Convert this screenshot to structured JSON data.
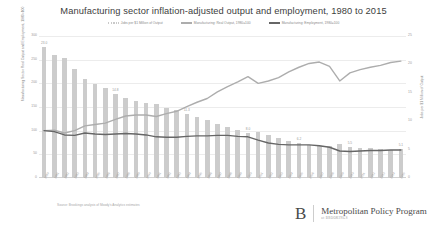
{
  "chart_data": {
    "type": "bar",
    "title": "Manufacturing sector inflation-adjusted output and employment, 1980 to 2015",
    "xlabel": "",
    "ylabel": "Manufacturing Sector Real Output and Employment, 1980=100",
    "ylabel_right": "Jobs per $1 Million of Output",
    "ylim": [
      0,
      300
    ],
    "ylim_right": [
      0,
      25
    ],
    "yticks": [
      0,
      50,
      100,
      150,
      200,
      250,
      300
    ],
    "yticks_right": [
      0,
      5,
      10,
      15,
      20,
      25
    ],
    "grid": true,
    "legend_position": "top-center",
    "categories": [
      "1980",
      "1981",
      "1982",
      "1983",
      "1984",
      "1985",
      "1986",
      "1987",
      "1988",
      "1989",
      "1990",
      "1991",
      "1992",
      "1993",
      "1994",
      "1995",
      "1996",
      "1997",
      "1998",
      "1999",
      "2000",
      "2001",
      "2002",
      "2003",
      "2004",
      "2005",
      "2006",
      "2007",
      "2008",
      "2009",
      "2010",
      "2011",
      "2012",
      "2013",
      "2014",
      "2015"
    ],
    "series": [
      {
        "name": "Jobs per $1 Million of Output",
        "type": "bar",
        "axis": "right",
        "color": "#cccccc",
        "values": [
          23.0,
          21.6,
          21.2,
          19.2,
          17.5,
          16.5,
          15.9,
          14.8,
          14.0,
          13.6,
          13.2,
          13.0,
          12.3,
          11.9,
          11.3,
          10.7,
          10.2,
          9.5,
          9.0,
          8.5,
          8.0,
          8.1,
          7.5,
          7.1,
          6.6,
          6.2,
          5.9,
          5.6,
          5.7,
          6.0,
          5.5,
          5.3,
          5.2,
          5.1,
          5.0,
          5.1
        ],
        "labeled_points": [
          {
            "category": "1980",
            "value": 23.0,
            "label": "23.0"
          },
          {
            "category": "1987",
            "value": 14.8,
            "label": "14.8"
          },
          {
            "category": "1994",
            "value": 11.3,
            "label": "11.3"
          },
          {
            "category": "2000",
            "value": 8.0,
            "label": "8.0"
          },
          {
            "category": "2005",
            "value": 6.2,
            "label": "6.2"
          },
          {
            "category": "2010",
            "value": 5.5,
            "label": "5.5"
          },
          {
            "category": "2015",
            "value": 5.1,
            "label": "5.1"
          }
        ]
      },
      {
        "name": "Manufacturing: Real Output, 1980=100",
        "type": "line",
        "axis": "left",
        "color": "#adadad",
        "values": [
          100,
          101,
          95,
          100,
          110,
          113,
          116,
          124,
          131,
          133,
          133,
          130,
          136,
          141,
          151,
          160,
          168,
          182,
          193,
          203,
          214,
          200,
          205,
          212,
          224,
          234,
          242,
          245,
          236,
          205,
          222,
          229,
          234,
          238,
          244,
          247
        ]
      },
      {
        "name": "Manufacturing: Employment, 1980=100",
        "type": "line",
        "axis": "left",
        "color": "#666666",
        "values": [
          100,
          98,
          91,
          90,
          95,
          93,
          92,
          93,
          94,
          93,
          91,
          87,
          86,
          86,
          88,
          89,
          89,
          90,
          90,
          88,
          87,
          80,
          74,
          71,
          70,
          70,
          70,
          68,
          65,
          57,
          56,
          57,
          58,
          58,
          59,
          59
        ]
      }
    ],
    "source": "Source: Brookings analysis of Moody's Analytics estimates"
  },
  "branding": {
    "monogram": "B",
    "program": "Metropolitan Policy Program",
    "institution": "at BROOKINGS"
  }
}
